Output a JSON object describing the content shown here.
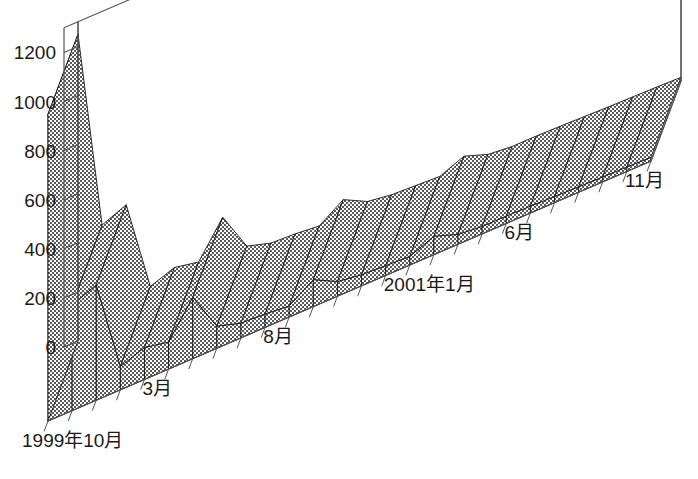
{
  "chart_data": {
    "type": "area",
    "render": "3d-ribbon",
    "title": "",
    "subtitle": "",
    "xlabel": "",
    "ylabel": "",
    "ylim": [
      0,
      1300
    ],
    "yticks": [
      0,
      200,
      400,
      600,
      800,
      1000,
      1200
    ],
    "ytick_labels": [
      "0",
      "200",
      "400",
      "600",
      "800",
      "1000",
      "1200"
    ],
    "grid": true,
    "grid_axis": "y",
    "legend": "none",
    "legend_entries": [],
    "annotations": [],
    "series_fill_color": "#808080",
    "series_fill_pattern": "checkerboard-dither",
    "series_edge_color": "#1a1a1a",
    "axis_color": "#555555",
    "background_color": "#ffffff",
    "x_tick_interval": "monthly",
    "xtick_labels": [
      {
        "index": 0,
        "label": "1999年10月"
      },
      {
        "index": 5,
        "label": "3月"
      },
      {
        "index": 10,
        "label": "8月"
      },
      {
        "index": 15,
        "label": "2001年1月"
      },
      {
        "index": 20,
        "label": "6月"
      },
      {
        "index": 25,
        "label": "11月"
      }
    ],
    "categories": [
      "1999年10月",
      "11月",
      "12月",
      "2000年1月",
      "2月",
      "3月",
      "4月",
      "5月",
      "6月",
      "7月",
      "8月",
      "9月",
      "10月",
      "11月",
      "12月",
      "2001年1月",
      "2月",
      "3月",
      "4月",
      "5月",
      "6月",
      "7月",
      "8月",
      "9月",
      "10月",
      "11月"
    ],
    "values": [
      1250,
      430,
      470,
      95,
      130,
      110,
      250,
      90,
      60,
      55,
      45,
      110,
      60,
      45,
      40,
      35,
      75,
      40,
      30,
      30,
      28,
      25,
      22,
      20,
      18,
      15
    ]
  }
}
